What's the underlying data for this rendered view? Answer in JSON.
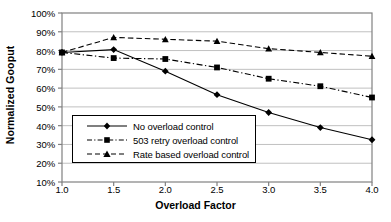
{
  "chart_data": {
    "type": "line",
    "title": "",
    "subtitle": "",
    "xlabel": "Overload Factor",
    "ylabel": "Normalized Gooput",
    "x": [
      1.0,
      1.5,
      2.0,
      2.5,
      3.0,
      3.5,
      4.0
    ],
    "xtick_labels": [
      "1.0",
      "1.5",
      "2.0",
      "2.5",
      "3.0",
      "3.5",
      "4.0"
    ],
    "ytick_labels": [
      "100%",
      "90%",
      "80%",
      "70%",
      "60%",
      "50%",
      "40%",
      "30%",
      "20%",
      "10%"
    ],
    "ytick_values": [
      100,
      90,
      80,
      70,
      60,
      50,
      40,
      30,
      20,
      10
    ],
    "xlim": [
      1.0,
      4.0
    ],
    "ylim": [
      10,
      100
    ],
    "grid": "horizontal",
    "legend_position": "lower-left-inside",
    "series": [
      {
        "name": "No overload control",
        "marker": "diamond",
        "linestyle": "solid",
        "color": "#000000",
        "values": [
          79,
          80.5,
          69,
          56.5,
          47,
          39,
          32.5
        ]
      },
      {
        "name": "503 retry overload control",
        "marker": "square",
        "linestyle": "dash-dot",
        "color": "#000000",
        "values": [
          79,
          76,
          75.5,
          71,
          65,
          61,
          55
        ]
      },
      {
        "name": "Rate based overload control",
        "marker": "triangle",
        "linestyle": "dashed",
        "color": "#000000",
        "values": [
          79,
          87,
          86,
          85,
          81,
          79,
          77
        ]
      }
    ]
  },
  "legend": {
    "entries": [
      {
        "label": "No overload control"
      },
      {
        "label": "503 retry overload control"
      },
      {
        "label": "Rate based overload control"
      }
    ]
  },
  "axes": {
    "y_title": "Normalized Gooput",
    "x_title": "Overload Factor"
  },
  "colors": {
    "line": "#000000",
    "grid": "#c0c0c0",
    "axis": "#808080",
    "background": "#ffffff"
  }
}
